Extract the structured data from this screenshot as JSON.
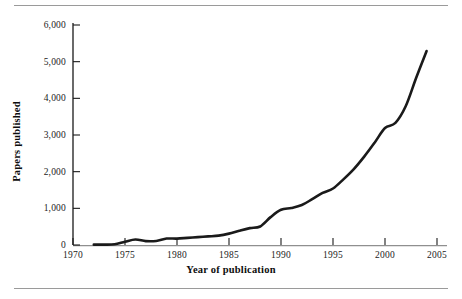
{
  "figure": {
    "has_top_rule": true,
    "has_bottom_rule": true,
    "rule_color": "#9a9a9a",
    "background": "#ffffff"
  },
  "chart_data": {
    "type": "line",
    "title": "",
    "subtitle": "",
    "xlabel": "Year of publication",
    "ylabel": "Papers published",
    "xlim": [
      1970,
      2005
    ],
    "ylim": [
      0,
      6000
    ],
    "grid": false,
    "legend": null,
    "line_color": "#1a1a1a",
    "line_width": 2.6,
    "x_ticks": [
      1970,
      1975,
      1980,
      1985,
      1990,
      1995,
      2000,
      2005
    ],
    "x_tick_labels": [
      "1970",
      "1975",
      "1980",
      "1985",
      "1990",
      "1995",
      "2000",
      "2005"
    ],
    "y_ticks": [
      0,
      1000,
      2000,
      3000,
      4000,
      5000,
      6000
    ],
    "y_tick_labels": [
      "0",
      "1,000",
      "2,000",
      "3,000",
      "4,000",
      "5,000",
      "6,000"
    ],
    "series": [
      {
        "name": "Papers published",
        "x": [
          1972,
          1973,
          1974,
          1975,
          1976,
          1977,
          1978,
          1979,
          1980,
          1981,
          1982,
          1983,
          1984,
          1985,
          1986,
          1987,
          1988,
          1989,
          1990,
          1991,
          1992,
          1993,
          1994,
          1995,
          1996,
          1997,
          1998,
          1999,
          2000,
          2001,
          2002,
          2003,
          2004
        ],
        "values": [
          10,
          10,
          20,
          90,
          150,
          105,
          110,
          175,
          175,
          195,
          215,
          235,
          255,
          310,
          390,
          460,
          505,
          760,
          960,
          1010,
          1090,
          1250,
          1420,
          1540,
          1790,
          2070,
          2410,
          2790,
          3190,
          3330,
          3790,
          4560,
          5290
        ]
      }
    ]
  },
  "axes": {
    "y_title": "Papers published",
    "x_title": "Year of publication"
  }
}
